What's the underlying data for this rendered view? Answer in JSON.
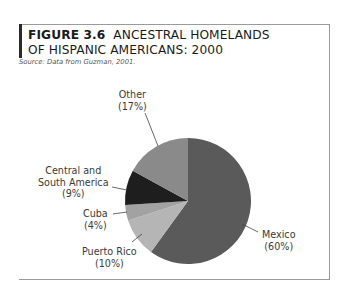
{
  "figure": {
    "number": "FIGURE 3.6",
    "title_line1": "ANCESTRAL HOMELANDS",
    "title_line2": "OF HISPANIC AMERICANS: 2000",
    "source": "Source: Data from Guzman, 2001."
  },
  "labels": {
    "mexico": {
      "name": "Mexico",
      "pct": "(60%)"
    },
    "puerto_rico": {
      "name": "Puerto Rico",
      "pct": "(10%)"
    },
    "cuba": {
      "name": "Cuba",
      "pct": "(4%)"
    },
    "csa": {
      "name1": "Central and",
      "name2": "South America",
      "pct": "(9%)"
    },
    "other": {
      "name": "Other",
      "pct": "(17%)"
    }
  },
  "chart_data": {
    "type": "pie",
    "subtitle": "Source: Data from Guzman, 2001.",
    "categories": [
      "Mexico",
      "Puerto Rico",
      "Cuba",
      "Central and South America",
      "Other"
    ],
    "values": [
      60,
      10,
      4,
      9,
      17
    ],
    "unit": "%",
    "start_angle": "12 o'clock",
    "direction": "clockwise",
    "colors": [
      "#5a5a5a",
      "#b5b5b5",
      "#a2a2a2",
      "#1e1e1e",
      "#8a8a8a"
    ],
    "legend": "none (direct labels with leader lines)"
  }
}
